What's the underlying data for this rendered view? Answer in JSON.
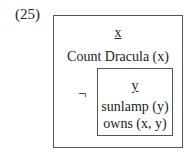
{
  "example_number": "(25)",
  "drs": {
    "referents": [
      "x"
    ],
    "conditions": [
      "Count Dracula (x)"
    ],
    "negated_box": {
      "operator": "¬",
      "referents": [
        "y"
      ],
      "conditions": [
        "sunlamp (y)",
        "owns (x, y)"
      ]
    }
  }
}
